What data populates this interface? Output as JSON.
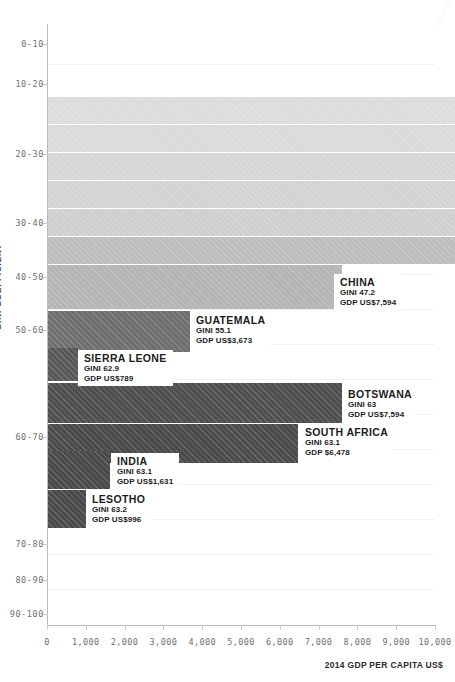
{
  "chart_data": {
    "type": "bar",
    "title": "",
    "xlabel": "2014 GDP PER CAPITA US$",
    "ylabel": "GINI COEFFICIENT",
    "xlim": [
      0,
      10000
    ],
    "xticks": [
      0,
      1000,
      2000,
      3000,
      4000,
      5000,
      6000,
      7000,
      8000,
      9000,
      10000
    ],
    "xticklabels": [
      "0",
      "1,000",
      "2,000",
      "3,000",
      "4,000",
      "5,000",
      "6,000",
      "7,000",
      "8,000",
      "9,000",
      "10,000"
    ],
    "yticklabels": [
      "0-10",
      "10-20",
      "20-30",
      "30-40",
      "40-50",
      "50-60",
      "60-70",
      "80-90",
      "70-80",
      "90-100"
    ],
    "ycategories": [
      "0-10",
      "10-20",
      "20-30",
      "30-40",
      "40-50",
      "50-60",
      "60-70",
      "70-80",
      "80-90",
      "90-100"
    ],
    "grid": true,
    "legend": "none",
    "orientation": "horizontal",
    "bars": [
      {
        "label": "",
        "gini": null,
        "gdp": 11200,
        "gini_text": "",
        "gdp_text": "",
        "color": "#dcdcdc",
        "row": 0,
        "labeled": false
      },
      {
        "label": "",
        "gini": null,
        "gdp": 11200,
        "gini_text": "",
        "gdp_text": "",
        "color": "#d9d9d9",
        "row": 1,
        "labeled": false
      },
      {
        "label": "",
        "gini": null,
        "gdp": 11200,
        "gini_text": "",
        "gdp_text": "",
        "color": "#d4d4d4",
        "row": 2,
        "labeled": false
      },
      {
        "label": "",
        "gini": null,
        "gdp": 11200,
        "gini_text": "",
        "gdp_text": "",
        "color": "#cdcdcd",
        "row": 3,
        "labeled": false
      },
      {
        "label": "",
        "gini": null,
        "gdp": 11200,
        "gini_text": "",
        "gdp_text": "",
        "color": "#bdbdbd",
        "row": 4,
        "labeled": false
      },
      {
        "label": "CHINA",
        "gini": 47.2,
        "gdp": 7594,
        "gini_text": "GINI 47.2",
        "gdp_text": "GDP US$7,594",
        "color": "#b4b4b4",
        "row": 5,
        "labeled": true
      },
      {
        "label": "GUATEMALA",
        "gini": 55.1,
        "gdp": 3673,
        "gini_text": "GINI 55.1",
        "gdp_text": "GDP US$3,673",
        "color": "#6e6e6e",
        "row": 6,
        "labeled": true
      },
      {
        "label": "SIERRA LEONE",
        "gini": 62.9,
        "gdp": 789,
        "gini_text": "GINI 62.9",
        "gdp_text": "GDP US$789",
        "color": "#575757",
        "row": 7,
        "labeled": true
      },
      {
        "label": "BOTSWANA",
        "gini": 63,
        "gdp": 7594,
        "gini_text": "GINI 63",
        "gdp_text": "GDP US$7,594",
        "color": "#4e4e4e",
        "row": 8,
        "labeled": true
      },
      {
        "label": "SOUTH AFRICA",
        "gini": 63.1,
        "gdp": 6478,
        "gini_text": "GINI 63.1",
        "gdp_text": "GDP $6,478",
        "color": "#4a4a4a",
        "row": 9,
        "labeled": true
      },
      {
        "label": "INDIA",
        "gini": 63.1,
        "gdp": 1631,
        "gini_text": "GINI 63.1",
        "gdp_text": "GDP US$1,631",
        "color": "#4a4a4a",
        "row": 10,
        "labeled": true
      },
      {
        "label": "LESOTHO",
        "gini": 63.2,
        "gdp": 996,
        "gini_text": "GINI 63.2",
        "gdp_text": "GDP US$996",
        "color": "#4a4a4a",
        "row": 11,
        "labeled": true
      }
    ]
  },
  "axes": {
    "y_title": "GINI COEFFICIENT",
    "x_title": "2014 GDP PER CAPITA US$",
    "y_labels": [
      {
        "text": "0-10",
        "y": 44
      },
      {
        "text": "10-20",
        "y": 84
      },
      {
        "text": "20-30",
        "y": 154
      },
      {
        "text": "30-40",
        "y": 223
      },
      {
        "text": "40-50",
        "y": 277
      },
      {
        "text": "50-60",
        "y": 330
      },
      {
        "text": "60-70",
        "y": 437
      },
      {
        "text": "70-80",
        "y": 544
      },
      {
        "text": "80-90",
        "y": 580
      },
      {
        "text": "90-100",
        "y": 614
      }
    ],
    "x_labels": [
      "0",
      "1,000",
      "2,000",
      "3,000",
      "4,000",
      "5,000",
      "6,000",
      "7,000",
      "8,000",
      "9,000",
      "10,000"
    ]
  }
}
